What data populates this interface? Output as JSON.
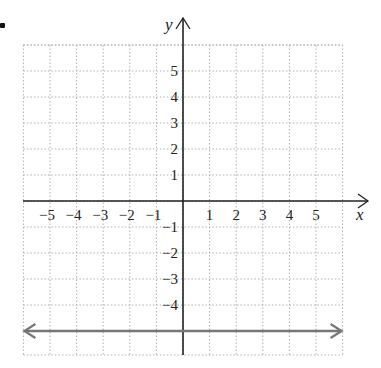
{
  "chart_data": {
    "type": "line",
    "title": "",
    "xlabel": "x",
    "ylabel": "y",
    "xlim": [
      -6,
      6
    ],
    "ylim": [
      -6,
      6
    ],
    "grid": true,
    "x_tick_labels": [
      "−5",
      "−4",
      "−3",
      "−2",
      "−1",
      "1",
      "2",
      "3",
      "4",
      "5"
    ],
    "x_ticks": [
      -5,
      -4,
      -3,
      -2,
      -1,
      1,
      2,
      3,
      4,
      5
    ],
    "y_tick_labels": [
      "5",
      "4",
      "3",
      "2",
      "1",
      "−1",
      "−2",
      "−3",
      "−4"
    ],
    "y_ticks": [
      5,
      4,
      3,
      2,
      1,
      -1,
      -2,
      -3,
      -4
    ],
    "series": [
      {
        "name": "y = -5",
        "equation": "y = -5",
        "x": [
          -6,
          6
        ],
        "y": [
          -5,
          -5
        ],
        "arrows": "both",
        "color": "#777777"
      }
    ],
    "colors": {
      "axis": "#222222",
      "grid": "#b0b0b0",
      "line": "#777777"
    }
  }
}
